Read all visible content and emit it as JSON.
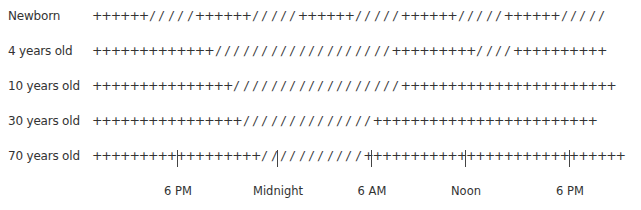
{
  "chart_data": {
    "type": "table",
    "title": "",
    "legend": {
      "+": "awake",
      "/": "asleep"
    },
    "rows": [
      {
        "label": "Newborn",
        "runs": [
          [
            "+",
            6
          ],
          [
            "/",
            5
          ],
          [
            "+",
            6
          ],
          [
            "/",
            5
          ],
          [
            "+",
            6
          ],
          [
            "/",
            5
          ],
          [
            "+",
            6
          ],
          [
            "/",
            5
          ],
          [
            "+",
            6
          ],
          [
            "/",
            5
          ]
        ]
      },
      {
        "label": "4 years old",
        "runs": [
          [
            "+",
            13
          ],
          [
            "/",
            19
          ],
          [
            "+",
            9
          ],
          [
            "/",
            4
          ],
          [
            "+",
            10
          ]
        ]
      },
      {
        "label": "10 years old",
        "runs": [
          [
            "+",
            15
          ],
          [
            "/",
            18
          ],
          [
            "+",
            23
          ]
        ]
      },
      {
        "label": "30 years old",
        "runs": [
          [
            "+",
            16
          ],
          [
            "/",
            14
          ],
          [
            "+",
            24
          ]
        ]
      },
      {
        "label": "70 years old",
        "runs": [
          [
            "+",
            18
          ],
          [
            "/",
            11
          ],
          [
            "+",
            28
          ]
        ]
      }
    ],
    "x_ticks": [
      "6 PM",
      "Midnight",
      "6 AM",
      "Noon",
      "6 PM"
    ]
  }
}
